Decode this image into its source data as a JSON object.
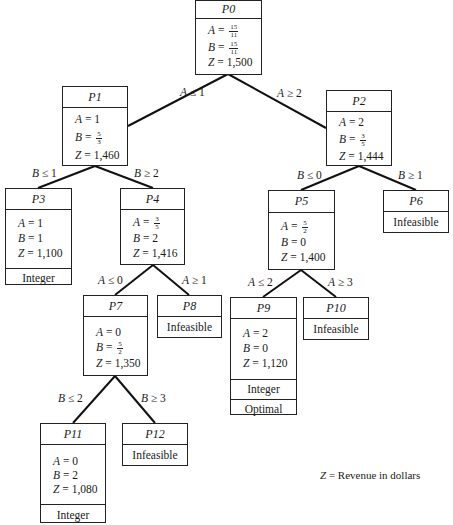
{
  "diagram": {
    "type": "branch-and-bound tree",
    "legend": {
      "var": "Z",
      "text": " = Revenue in dollars"
    },
    "nodes": {
      "P0": {
        "id": "P0",
        "A": {
          "num": "15",
          "den": "11"
        },
        "B": {
          "num": "15",
          "den": "11"
        },
        "Z": "1,500"
      },
      "P1": {
        "id": "P1",
        "A": "1",
        "B": {
          "num": "5",
          "den": "3"
        },
        "Z": "1,460"
      },
      "P2": {
        "id": "P2",
        "A": "2",
        "B": {
          "num": "3",
          "den": "5"
        },
        "Z": "1,444"
      },
      "P3": {
        "id": "P3",
        "A": "1",
        "B": "1",
        "Z": "1,100",
        "status": [
          "Integer"
        ]
      },
      "P4": {
        "id": "P4",
        "A": {
          "num": "3",
          "den": "5"
        },
        "B": "2",
        "Z": "1,416"
      },
      "P5": {
        "id": "P5",
        "A": {
          "num": "5",
          "den": "2"
        },
        "B": "0",
        "Z": "1,400"
      },
      "P6": {
        "id": "P6",
        "status": [
          "Infeasible"
        ]
      },
      "P7": {
        "id": "P7",
        "A": "0",
        "B": {
          "num": "5",
          "den": "2"
        },
        "Z": "1,350"
      },
      "P8": {
        "id": "P8",
        "status": [
          "Infeasible"
        ]
      },
      "P9": {
        "id": "P9",
        "A": "2",
        "B": "0",
        "Z": "1,120",
        "status": [
          "Integer",
          "Optimal"
        ]
      },
      "P10": {
        "id": "P10",
        "status": [
          "Infeasible"
        ]
      },
      "P11": {
        "id": "P11",
        "A": "0",
        "B": "2",
        "Z": "1,080",
        "status": [
          "Integer"
        ]
      },
      "P12": {
        "id": "P12",
        "status": [
          "Infeasible"
        ]
      }
    },
    "labels": {
      "eq": " = ",
      "A": "A",
      "B": "B",
      "Z": "Z",
      "e01": {
        "var": "A",
        "op": " ≤ 1"
      },
      "e02": {
        "var": "A",
        "op": " ≥ 2"
      },
      "e13": {
        "var": "B",
        "op": " ≤ 1"
      },
      "e14": {
        "var": "B",
        "op": " ≥ 2"
      },
      "e25": {
        "var": "B",
        "op": " ≤ 0"
      },
      "e26": {
        "var": "B",
        "op": " ≥ 1"
      },
      "e47": {
        "var": "A",
        "op": " ≤ 0"
      },
      "e48": {
        "var": "A",
        "op": " ≥ 1"
      },
      "e59": {
        "var": "A",
        "op": " ≤ 2"
      },
      "e510": {
        "var": "A",
        "op": " ≥ 3"
      },
      "e711": {
        "var": "B",
        "op": " ≤ 2"
      },
      "e712": {
        "var": "B",
        "op": " ≥ 3"
      }
    }
  }
}
